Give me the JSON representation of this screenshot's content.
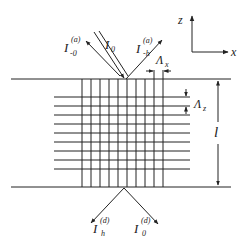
{
  "diagram": {
    "type": "grating-diffraction-schematic",
    "axes": {
      "vertical_label": "z",
      "horizontal_label": "x"
    },
    "incident_beam": {
      "symbol": "I",
      "subscript": "0",
      "superscript": ""
    },
    "reflected_beams": [
      {
        "symbol": "I",
        "subscript": "-0",
        "superscript": "(a)"
      },
      {
        "symbol": "I",
        "subscript": "-h",
        "superscript": "(a)"
      }
    ],
    "transmitted_beams": [
      {
        "symbol": "I",
        "subscript": "h",
        "superscript": "(d)"
      },
      {
        "symbol": "I",
        "subscript": "0",
        "superscript": "(d)"
      }
    ],
    "period_labels": {
      "x": {
        "symbol": "Λ",
        "subscript": "x"
      },
      "z": {
        "symbol": "Λ",
        "subscript": "z"
      }
    },
    "thickness_label": "l",
    "grid": {
      "vertical_lines": 10,
      "horizontal_lines": 9
    },
    "colors": {
      "line": "#222222",
      "background": "#ffffff"
    }
  }
}
